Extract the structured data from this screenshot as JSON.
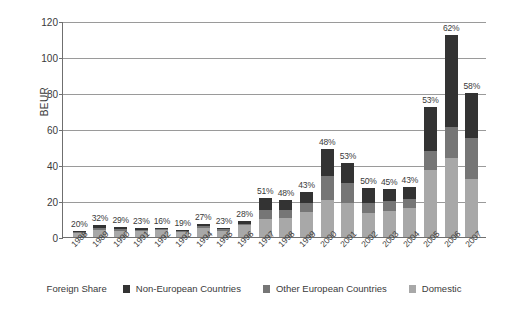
{
  "chart_data": {
    "type": "bar",
    "stacked": true,
    "title": "",
    "xlabel": "",
    "ylabel": "BEUR",
    "ylim": [
      0,
      120
    ],
    "yticks": [
      0,
      20,
      40,
      60,
      80,
      100,
      120
    ],
    "grid": "horizontal",
    "legend_position": "bottom",
    "categories": [
      "1988",
      "1989",
      "1990",
      "1991",
      "1992",
      "1993",
      "1994",
      "1995",
      "1996",
      "1997",
      "1998",
      "1999",
      "2000",
      "2001",
      "2002",
      "2003",
      "2004",
      "2005",
      "2006",
      "2007"
    ],
    "series": [
      {
        "name": "Domestic",
        "color": "#a8a8a8",
        "values": [
          2.4,
          4.1,
          3.4,
          3.3,
          3.8,
          2.9,
          5.1,
          3.6,
          6.5,
          10.0,
          10.4,
          14.0,
          20.5,
          19.0,
          13.5,
          14.5,
          16.0,
          37.0,
          44.0,
          32.0
        ]
      },
      {
        "name": "Other European Countries",
        "color": "#767676",
        "values": [
          0.3,
          1.0,
          1.0,
          0.8,
          0.5,
          0.4,
          1.0,
          0.6,
          1.0,
          5.0,
          4.6,
          5.0,
          13.5,
          11.0,
          5.5,
          5.5,
          5.0,
          11.0,
          17.0,
          23.0
        ]
      },
      {
        "name": "Non-European Countries",
        "color": "#333333",
        "values": [
          0.6,
          1.4,
          1.1,
          1.0,
          0.9,
          0.7,
          1.4,
          0.9,
          1.6,
          6.5,
          5.5,
          6.0,
          15.0,
          11.0,
          8.0,
          6.5,
          7.0,
          24.0,
          51.0,
          25.0
        ]
      }
    ],
    "totals": [
      3.3,
      6.5,
      5.5,
      5.1,
      5.2,
      4.0,
      7.5,
      5.1,
      9.1,
      21.5,
      20.5,
      25.0,
      49.0,
      41.0,
      27.0,
      26.5,
      28.0,
      72.0,
      112.0,
      80.0
    ],
    "data_labels": {
      "name": "Foreign Share",
      "values": [
        "20%",
        "32%",
        "29%",
        "23%",
        "16%",
        "19%",
        "27%",
        "23%",
        "28%",
        "51%",
        "48%",
        "43%",
        "48%",
        "53%",
        "50%",
        "45%",
        "43%",
        "53%",
        "62%",
        "58%"
      ]
    },
    "legend": {
      "lead_label": "Foreign Share",
      "entries": [
        {
          "label": "Non-European Countries",
          "color": "#333333"
        },
        {
          "label": "Other European Countries",
          "color": "#767676"
        },
        {
          "label": "Domestic",
          "color": "#a8a8a8"
        }
      ]
    }
  }
}
